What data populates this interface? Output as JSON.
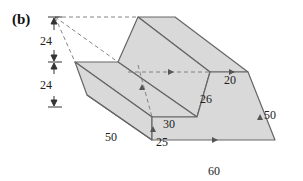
{
  "figure": {
    "panel_label": "(b)",
    "colors": {
      "face_fill": "#d9d9d9",
      "edge": "#666666",
      "dash": "#777777",
      "text": "#222222"
    },
    "dimensions": {
      "height_upper": "24",
      "height_lower": "24",
      "depth_left": "50",
      "groove_bottom": "30",
      "groove_wall": "26",
      "top_ledge": "20",
      "right_height": "50",
      "front_width": "60",
      "front_height": "25"
    }
  }
}
